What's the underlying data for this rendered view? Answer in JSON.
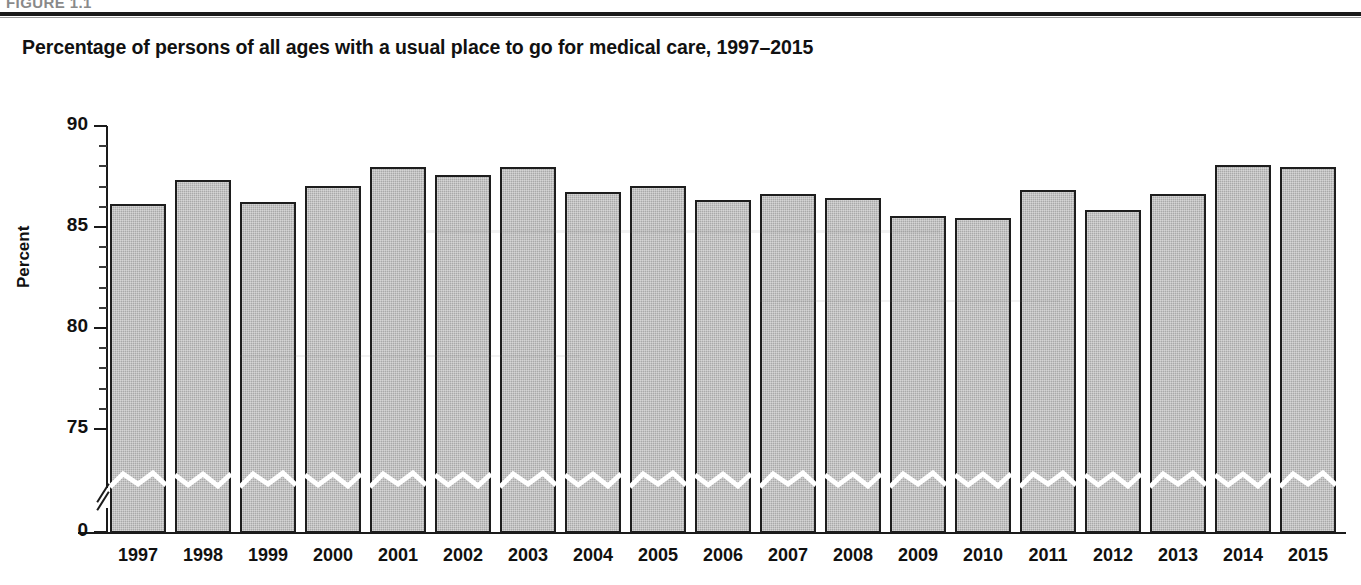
{
  "figure": {
    "number_text": "FIGURE 1.1",
    "title": "Percentage of persons of all ages with a usual place to go for medical care, 1997–2015"
  },
  "axes": {
    "y_axis_title": "Percent",
    "y_ticks": [
      "0",
      "75",
      "80",
      "85",
      "90"
    ],
    "y_break_note": "axis break between 0 and 75",
    "x_axis_title": ""
  },
  "colors": {
    "bar_fill": "#a9a9a9",
    "bar_border": "#1d1d1d",
    "axis": "#1a1a1a",
    "text": "#111111",
    "background": "#ffffff"
  },
  "chart_data": {
    "type": "bar",
    "title": "Percentage of persons of all ages with a usual place to go for medical care, 1997–2015",
    "xlabel": "",
    "ylabel": "Percent",
    "ylim": [
      75,
      90
    ],
    "yticks": [
      75,
      80,
      85,
      90
    ],
    "y_axis_broken": true,
    "grid": false,
    "legend": null,
    "categories": [
      "1997",
      "1998",
      "1999",
      "2000",
      "2001",
      "2002",
      "2003",
      "2004",
      "2005",
      "2006",
      "2007",
      "2008",
      "2009",
      "2010",
      "2011",
      "2012",
      "2013",
      "2014",
      "2015"
    ],
    "values": [
      86.2,
      87.4,
      86.3,
      87.1,
      88.0,
      87.6,
      88.0,
      86.8,
      87.1,
      86.4,
      86.7,
      86.5,
      85.6,
      85.5,
      86.9,
      85.9,
      86.7,
      88.1,
      88.0
    ]
  }
}
